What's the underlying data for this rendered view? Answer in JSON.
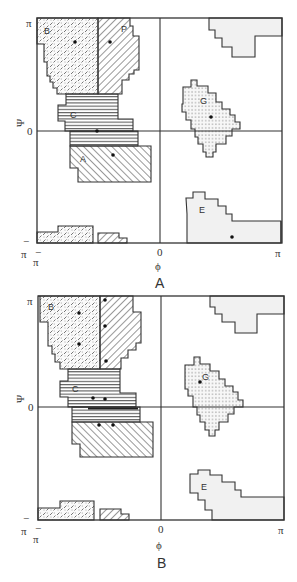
{
  "figure": {
    "panels": [
      {
        "id": "A",
        "caption": "A",
        "x_axis_label": "ϕ",
        "y_axis_label": "Ψ",
        "x_ticks": {
          "min": "π",
          "min_sign": "−",
          "zero": "0",
          "max": "π"
        },
        "y_ticks": {
          "max": "π",
          "zero": "0",
          "min": "π",
          "min_sign": "−"
        },
        "regions": [
          {
            "label": "B",
            "pattern": "crosshatch-dashes"
          },
          {
            "label": "P",
            "pattern": "diagonal-left"
          },
          {
            "label": "C",
            "pattern": "horizontal-lines"
          },
          {
            "label": "A",
            "pattern": "diagonal-right"
          },
          {
            "label": "G",
            "pattern": "dotted"
          },
          {
            "label": "E",
            "pattern": "light-gray"
          }
        ]
      },
      {
        "id": "B",
        "caption": "B",
        "x_axis_label": "ϕ",
        "y_axis_label": "Ψ",
        "x_ticks": {
          "min": "π",
          "min_sign": "−",
          "zero": "0",
          "max": "π"
        },
        "y_ticks": {
          "max": "π",
          "zero": "0",
          "min": "π",
          "min_sign": "−"
        },
        "regions": [
          {
            "label": "B",
            "pattern": "crosshatch-dashes"
          },
          {
            "label": "P",
            "pattern": "diagonal-left"
          },
          {
            "label": "C",
            "pattern": "horizontal-lines"
          },
          {
            "label": "A",
            "pattern": "diagonal-right"
          },
          {
            "label": "G",
            "pattern": "dotted"
          },
          {
            "label": "E",
            "pattern": "light-gray"
          }
        ]
      }
    ]
  }
}
